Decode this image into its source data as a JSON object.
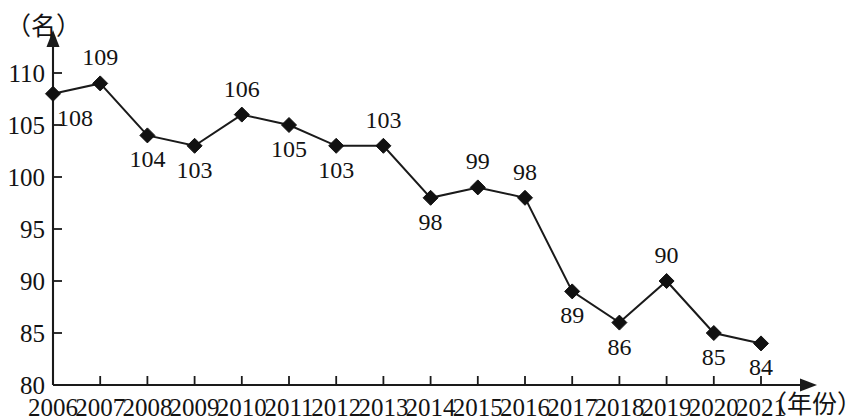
{
  "chart_data": {
    "type": "line",
    "title": "",
    "xlabel": "（年份）",
    "ylabel": "（名）",
    "x": [
      2006,
      2007,
      2008,
      2009,
      2010,
      2011,
      2012,
      2013,
      2014,
      2015,
      2016,
      2017,
      2018,
      2019,
      2020,
      2021
    ],
    "categories": [
      "2006",
      "2007",
      "2008",
      "2009",
      "2010",
      "2011",
      "2012",
      "2013",
      "2014",
      "2015",
      "2016",
      "2017",
      "2018",
      "2019",
      "2020",
      "2021"
    ],
    "values": [
      108,
      109,
      104,
      103,
      106,
      105,
      103,
      103,
      98,
      99,
      98,
      89,
      86,
      90,
      85,
      84
    ],
    "point_labels": [
      "108",
      "109",
      "104",
      "103",
      "106",
      "105",
      "103",
      "103",
      "98",
      "99",
      "98",
      "89",
      "86",
      "90",
      "85",
      "84"
    ],
    "label_positions": [
      "below",
      "above",
      "below",
      "below",
      "above",
      "below",
      "below",
      "above",
      "below",
      "above",
      "above",
      "below",
      "below",
      "above",
      "below",
      "below"
    ],
    "ylim": [
      80,
      112
    ],
    "yticks": [
      80,
      85,
      90,
      95,
      100,
      105,
      110
    ],
    "ytick_labels": [
      "80",
      "85",
      "90",
      "95",
      "100",
      "105",
      "110"
    ],
    "xlim": [
      2005.5,
      2022.2
    ],
    "grid": false,
    "legend": false,
    "marker": "diamond",
    "marker_color": "#111111",
    "line_color": "#1a1a1a",
    "axis_color": "#1a1a1a"
  }
}
